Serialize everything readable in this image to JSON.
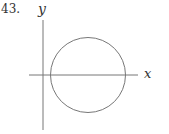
{
  "problem": {
    "number_label": "43."
  },
  "diagram": {
    "type": "circle-on-axes",
    "x_axis_label": "x",
    "y_axis_label": "y",
    "x_axis": {
      "x1": 29,
      "y": 75,
      "x2": 138
    },
    "y_axis": {
      "x": 43,
      "y1": 20,
      "y2": 130
    },
    "circle": {
      "cx": 88,
      "cy": 75,
      "r": 37.5
    },
    "stroke_color": "#777777"
  }
}
